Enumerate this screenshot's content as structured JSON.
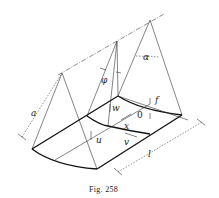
{
  "figure": {
    "caption": "Fig. 258",
    "labels": {
      "a": "a",
      "phi": "φ",
      "alpha": "α",
      "w": "w",
      "f": "f",
      "o": "0",
      "x": "x",
      "u": "u",
      "v": "v",
      "l": "l"
    }
  }
}
